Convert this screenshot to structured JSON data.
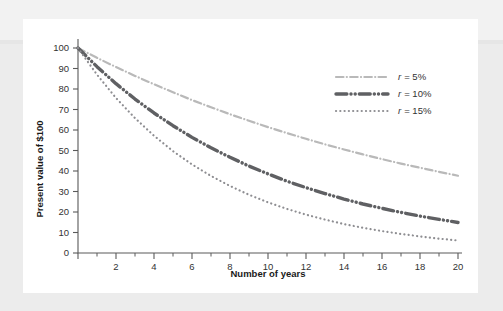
{
  "figure": {
    "background_color": "#ececec",
    "card_color": "#ffffff"
  },
  "chart_data": {
    "type": "line",
    "title": "",
    "xlabel": "Number of years",
    "ylabel": "Present value of $100",
    "xlim": [
      0,
      20
    ],
    "ylim": [
      0,
      100
    ],
    "grid": false,
    "legend_position": "upper right",
    "x_ticks": [
      0,
      2,
      4,
      6,
      8,
      10,
      12,
      14,
      16,
      18,
      20
    ],
    "x_tick_labels": [
      "",
      "2",
      "4",
      "6",
      "8",
      "10",
      "12",
      "14",
      "16",
      "18",
      "20"
    ],
    "x_minor_ticks": [
      1,
      3,
      5,
      7,
      9,
      11,
      13,
      15,
      17,
      19
    ],
    "y_ticks": [
      0,
      10,
      20,
      30,
      40,
      50,
      60,
      70,
      80,
      90,
      100
    ],
    "y_tick_labels": [
      "0",
      "10",
      "20",
      "30",
      "40",
      "50",
      "60",
      "70",
      "80",
      "90",
      "100"
    ],
    "x": [
      0,
      1,
      2,
      3,
      4,
      5,
      6,
      7,
      8,
      9,
      10,
      11,
      12,
      13,
      14,
      15,
      16,
      17,
      18,
      19,
      20
    ],
    "series": [
      {
        "name": "r = 5%",
        "rate": 0.05,
        "color": "#b9b9b9",
        "style": "dashdot",
        "width": 2.2,
        "values": [
          100,
          95.2,
          90.7,
          86.4,
          82.3,
          78.4,
          74.6,
          71.1,
          67.7,
          64.5,
          61.4,
          58.5,
          55.7,
          53.0,
          50.5,
          48.1,
          45.8,
          43.6,
          41.6,
          39.6,
          37.7
        ]
      },
      {
        "name": "r = 10%",
        "rate": 0.1,
        "color": "#5f6063",
        "style": "dashdotdot",
        "width": 3.4,
        "values": [
          100,
          90.9,
          82.6,
          75.1,
          68.3,
          62.1,
          56.4,
          51.3,
          46.7,
          42.4,
          38.6,
          35.0,
          31.9,
          29.0,
          26.3,
          23.9,
          21.8,
          19.8,
          18.0,
          16.4,
          14.9
        ]
      },
      {
        "name": "r = 15%",
        "rate": 0.15,
        "color": "#8e8e92",
        "style": "dotted",
        "width": 2.2,
        "values": [
          100,
          87.0,
          75.6,
          65.8,
          57.2,
          49.7,
          43.2,
          37.6,
          32.7,
          28.4,
          24.7,
          21.5,
          18.7,
          16.3,
          14.1,
          12.3,
          10.7,
          9.3,
          8.1,
          7.0,
          6.1
        ]
      }
    ],
    "legend_entries": [
      {
        "label_r": "r",
        "label_eq": "= 5%",
        "full": "r = 5%"
      },
      {
        "label_r": "r",
        "label_eq": "= 10%",
        "full": "r = 10%"
      },
      {
        "label_r": "r",
        "label_eq": "= 15%",
        "full": "r = 15%"
      }
    ]
  }
}
